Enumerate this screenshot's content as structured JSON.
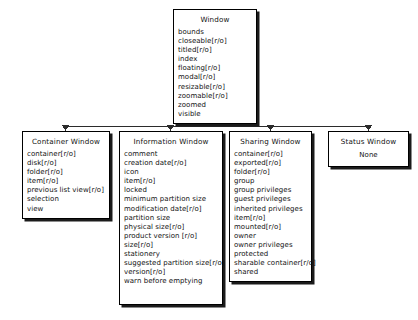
{
  "diagram": {
    "type": "class-hierarchy",
    "root": {
      "id": "window",
      "name": "Window",
      "attributes": [
        "bounds",
        "closeable[r/o]",
        "titled[r/o]",
        "index",
        "floating[r/o]",
        "modal[r/o]",
        "resizable[r/o]",
        "zoomable[r/o]",
        "zoomed",
        "visible"
      ]
    },
    "children": [
      {
        "id": "container-window",
        "name": "Container Window",
        "attributes": [
          "container[r/o]",
          "disk[r/o]",
          "folder[r/o]",
          "item[r/o]",
          "previous list view[r/o]",
          "selection",
          "view"
        ]
      },
      {
        "id": "information-window",
        "name": "Information Window",
        "attributes": [
          "comment",
          "creation date[r/o]",
          "icon",
          "item[r/o]",
          "locked",
          "minimum partition size",
          "modification date[r/o]",
          "partition size",
          "physical size[r/o]",
          "product version [r/o]",
          "size[r/o]",
          "stationery",
          "suggested partition size[r/o]",
          "version[r/o]",
          "warn before emptying"
        ]
      },
      {
        "id": "sharing-window",
        "name": "Sharing Window",
        "attributes": [
          "container[r/o]",
          "exported[r/o]",
          "folder[r/o]",
          "group",
          "group privileges",
          "guest privileges",
          "inherited privileges",
          "item[r/o]",
          "mounted[r/o]",
          "owner",
          "owner privileges",
          "protected",
          "sharable container[r/o]",
          "shared"
        ]
      },
      {
        "id": "status-window",
        "name": "Status Window",
        "attributes": [
          "None"
        ]
      }
    ],
    "colors": {
      "background": "#ffffff",
      "box_fill": "#ffffff",
      "box_border": "#000000",
      "shadow": "#1b1b1b",
      "connector": "#2b2b2b",
      "text": "#121212"
    }
  }
}
